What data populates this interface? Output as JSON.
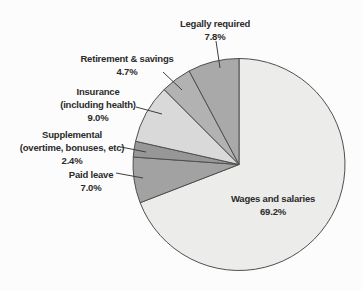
{
  "figure": {
    "background_color": "#fcfcfc"
  },
  "chart_data": {
    "type": "pie",
    "title": "",
    "units": "percent",
    "start_angle_deg": 0,
    "direction": "clockwise",
    "center": {
      "x": 239,
      "y": 164.5,
      "r": 106
    },
    "stroke_color": "#4f4f4f",
    "leader_color": "#3f3f3f",
    "label_color": "#2b2b2b",
    "categories": [
      "Wages and salaries",
      "Paid leave",
      "Supplemental (overtime, bonuses, etc)",
      "Insurance (including health)",
      "Retirement & savings",
      "Legally required"
    ],
    "values": [
      69.2,
      7.0,
      2.4,
      9.0,
      4.7,
      7.8
    ],
    "slices": [
      {
        "name": "wages-and-salaries",
        "label_lines": [
          "Wages and salaries"
        ],
        "pct_label": "69.2%",
        "value": 69.2,
        "color": "#ececea",
        "label_cx": 273,
        "label_top": 192,
        "leader": null
      },
      {
        "name": "paid-leave",
        "label_lines": [
          "Paid leave"
        ],
        "pct_label": "7.0%",
        "value": 7.0,
        "color": "#a2a2a2",
        "label_cx": 91,
        "label_top": 168,
        "leader": {
          "x1": 116,
          "y1": 173,
          "x2": 143,
          "y2": 178
        }
      },
      {
        "name": "supplemental",
        "label_lines": [
          "Supplemental",
          "(overtime, bonuses, etc)"
        ],
        "pct_label": "2.4%",
        "value": 2.4,
        "color": "#979797",
        "label_cx": 72,
        "label_top": 128,
        "leader": {
          "x1": 121,
          "y1": 147,
          "x2": 146,
          "y2": 152
        }
      },
      {
        "name": "insurance",
        "label_lines": [
          "Insurance",
          "(including health)"
        ],
        "pct_label": "9.0%",
        "value": 9.0,
        "color": "#d9d9d9",
        "label_cx": 98,
        "label_top": 85,
        "leader": {
          "x1": 136,
          "y1": 107,
          "x2": 162,
          "y2": 114
        }
      },
      {
        "name": "retirement-savings",
        "label_lines": [
          "Retirement & savings"
        ],
        "pct_label": "4.7%",
        "value": 4.7,
        "color": "#b2b2b2",
        "label_cx": 127,
        "label_top": 52,
        "leader": {
          "x1": 163,
          "y1": 72,
          "x2": 182,
          "y2": 90
        }
      },
      {
        "name": "legally-required",
        "label_lines": [
          "Legally required"
        ],
        "pct_label": "7.8%",
        "value": 7.8,
        "color": "#a9a9a9",
        "label_cx": 215,
        "label_top": 17,
        "leader": {
          "x1": 216,
          "y1": 41,
          "x2": 220,
          "y2": 68
        }
      }
    ]
  }
}
